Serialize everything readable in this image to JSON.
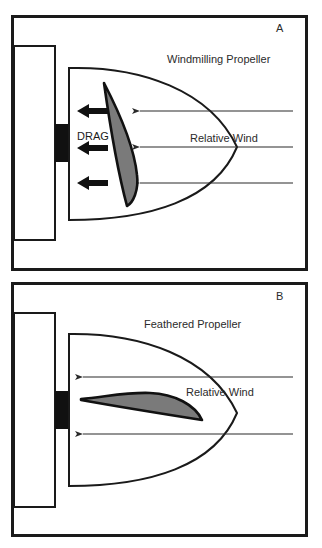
{
  "figure": {
    "panels": [
      {
        "id": "A",
        "letter": "A",
        "title": "Windmilling Propeller",
        "wind_label": "Relative Wind",
        "drag_label": "DRAG",
        "wind_arrow_count": 3,
        "drag_arrow_count": 3,
        "blade_orientation": "flat-to-wind"
      },
      {
        "id": "B",
        "letter": "B",
        "title": "Feathered Propeller",
        "wind_label": "Relative Wind",
        "wind_arrow_count": 2,
        "blade_orientation": "edge-on-to-wind"
      }
    ],
    "colors": {
      "line": "#1a1a1a",
      "blade_fill": "#7a7a7a",
      "hub": "#111111",
      "background": "#ffffff"
    }
  }
}
